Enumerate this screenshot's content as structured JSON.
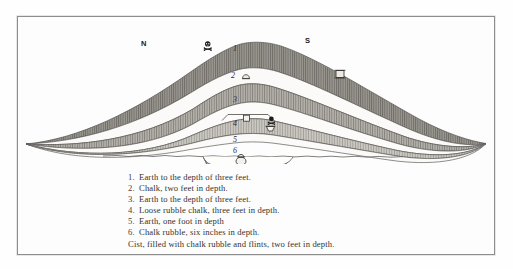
{
  "figure": {
    "title_alt": "Section of barrow showing stratified layers",
    "compass": {
      "north_label": "N",
      "south_label": "S"
    },
    "layer_markers": [
      {
        "id": "1",
        "label": "1"
      },
      {
        "id": "2",
        "label": "2"
      },
      {
        "id": "3",
        "label": "3"
      },
      {
        "id": "4",
        "label": "4"
      },
      {
        "id": "5",
        "label": "5"
      },
      {
        "id": "6",
        "label": "6"
      }
    ],
    "artifacts": [
      {
        "name": "skull-and-crossbones-upper-left",
        "kind": "skull-crossbones"
      },
      {
        "name": "urn-layer-two-left",
        "kind": "urn"
      },
      {
        "name": "urn-layer-two-right",
        "kind": "urn"
      },
      {
        "name": "urn-layer-four-left",
        "kind": "urn"
      },
      {
        "name": "skull-and-crossbones-layer-four",
        "kind": "skull-crossbones"
      },
      {
        "name": "bowl-layer-four",
        "kind": "bowl"
      },
      {
        "name": "urn-in-cist",
        "kind": "urn"
      }
    ],
    "colors": {
      "hatch_dark": "#8f8c87",
      "hatch_mid": "#a8a59f",
      "hatch_light": "#c3c0ba",
      "outline": "#5e5c58",
      "paper": "#fdfdfd",
      "border": "#8d8d8d"
    }
  },
  "caption": {
    "items": [
      {
        "number": "1.",
        "text": "Earth to the depth of three feet."
      },
      {
        "number": "2.",
        "text": "Chalk, two feet in depth."
      },
      {
        "number": "3.",
        "text": "Earth to the depth of three feet."
      },
      {
        "number": "4.",
        "text": "Loose rubble chalk, three feet in depth."
      },
      {
        "number": "5.",
        "text": "Earth, one foot in depth"
      },
      {
        "number": "6.",
        "text": "Chalk rubble, six inches in depth."
      }
    ],
    "final_line": "Cist, filled with chalk rubble and flints, two feet in depth."
  }
}
